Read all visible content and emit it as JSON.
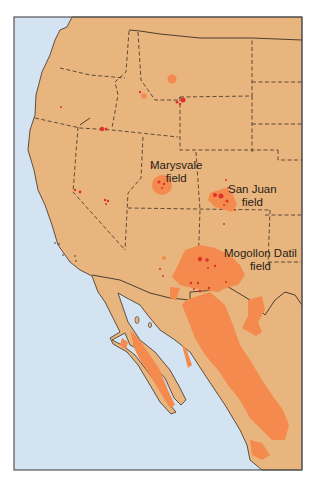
{
  "map": {
    "type": "geologic-region-map",
    "region": "Western United States and northwestern Mexico",
    "colors": {
      "ocean": "#d3e3f1",
      "land": "#e8b57e",
      "volcanic_field": "#f48a4d",
      "vent_dot": "#e0322a",
      "boundary": "#3b3026",
      "frame": "#555555"
    },
    "labels": [
      {
        "id": "marysvale",
        "line1": "Marysvale",
        "line2": "field"
      },
      {
        "id": "san-juan",
        "line1": "San Juan",
        "line2": "field"
      },
      {
        "id": "mogollon-datil",
        "line1": "Mogollon Datil",
        "line2": "field"
      }
    ]
  }
}
